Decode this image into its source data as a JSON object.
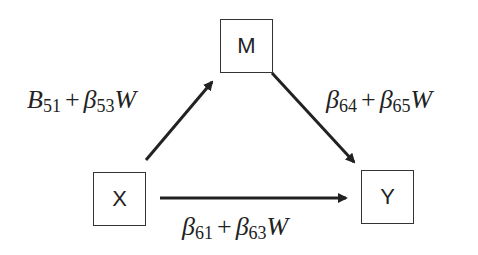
{
  "diagram": {
    "type": "moderated mediation path diagram",
    "nodes": [
      {
        "id": "M",
        "label": "M"
      },
      {
        "id": "X",
        "label": "X"
      },
      {
        "id": "Y",
        "label": "Y"
      }
    ],
    "edges": [
      {
        "from": "X",
        "to": "M",
        "label": {
          "a": "B",
          "a_sub": "51",
          "op": "+",
          "b": "β",
          "b_sub": "53",
          "w": "W"
        }
      },
      {
        "from": "M",
        "to": "Y",
        "label": {
          "a": "β",
          "a_sub": "64",
          "op": "+",
          "b": "β",
          "b_sub": "65",
          "w": "W"
        }
      },
      {
        "from": "X",
        "to": "Y",
        "label": {
          "a": "β",
          "a_sub": "61",
          "op": "+",
          "b": "β",
          "b_sub": "63",
          "w": "W"
        }
      }
    ],
    "colors": {
      "stroke": "#222222",
      "box_border": "#333333",
      "background": "#ffffff"
    }
  }
}
